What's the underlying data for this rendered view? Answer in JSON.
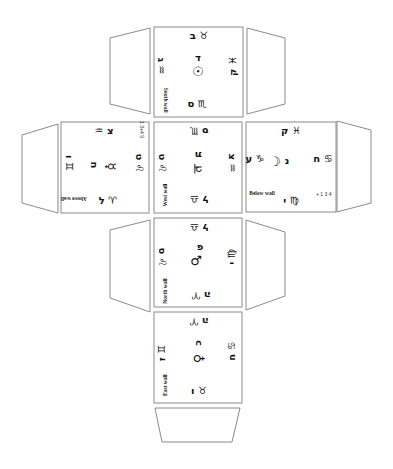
{
  "diagram": {
    "type": "cube-net",
    "colors": {
      "outline": "#8a8a8a",
      "ink": "#111111",
      "background": "#ffffff"
    },
    "faces": {
      "south": {
        "label": "South wall",
        "top": "ב ♉",
        "left": "ג ♒",
        "center_letter": "ד",
        "center_symbol": "☉",
        "right": "ק ♓",
        "bottom": "ס ♏"
      },
      "above": {
        "label": "Above wall",
        "small_note": "1\n3+4\n5",
        "top": "♒ צ",
        "left": "ו ♊",
        "center_letter": "ח",
        "center_symbol": "☿",
        "right": "ט ♌",
        "bottom": "ל ♈"
      },
      "west": {
        "label": "West wall",
        "top": "ס ♏",
        "left": "ט ♌",
        "center_letter": "ת",
        "center_symbol": "♃",
        "right": "צ ♒",
        "bottom": "ל ♎"
      },
      "below": {
        "label": "Below wall",
        "small_note": "+ 1 3\n4",
        "top": "ק ♓",
        "left": "ע ♑",
        "center_letter": "נ",
        "center_symbol": "☽",
        "right": "ח ♋",
        "bottom": "י ♍"
      },
      "north": {
        "label": "North wall",
        "top": "ל ♎",
        "left": "ס ♌",
        "center_letter": "פ",
        "center_symbol": "♂",
        "right": "י ♍",
        "bottom": "ה ♈"
      },
      "east": {
        "label": "East wall",
        "top": "ה ♈",
        "left": "ז ♊",
        "center_letter": "כ",
        "center_symbol": "♀",
        "right": "ח ♋",
        "bottom": "ו ♉"
      }
    }
  }
}
